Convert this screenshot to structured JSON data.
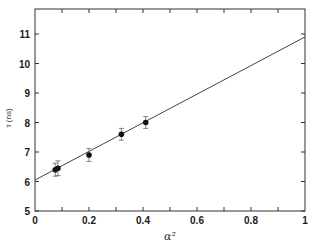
{
  "chart_data": {
    "type": "scatter",
    "title": "",
    "xlabel": "α²",
    "ylabel": "τ (ns)",
    "xlim": [
      0,
      1
    ],
    "ylim": [
      5,
      11.85
    ],
    "grid": false,
    "legend": null,
    "x_ticks": [
      0,
      0.2,
      0.4,
      0.6,
      0.8,
      1
    ],
    "x_tick_labels": [
      "0",
      "0.2",
      "0.4",
      "0.6",
      "0.8",
      "1"
    ],
    "y_ticks": [
      5,
      6,
      7,
      8,
      9,
      10,
      11
    ],
    "y_tick_labels": [
      "5",
      "6",
      "7",
      "8",
      "9",
      "10",
      "11"
    ],
    "series": [
      {
        "name": "measured",
        "type": "scatter",
        "marker": "filled-circle",
        "points": [
          {
            "x": 0.075,
            "y": 6.4,
            "err": 0.22
          },
          {
            "x": 0.085,
            "y": 6.45,
            "err": 0.25
          },
          {
            "x": 0.2,
            "y": 6.9,
            "err": 0.22
          },
          {
            "x": 0.32,
            "y": 7.6,
            "err": 0.2
          },
          {
            "x": 0.41,
            "y": 8.0,
            "err": 0.2
          }
        ]
      },
      {
        "name": "linear fit",
        "type": "line",
        "points": [
          {
            "x": 0,
            "y": 6.05
          },
          {
            "x": 1,
            "y": 10.9
          }
        ]
      }
    ]
  }
}
